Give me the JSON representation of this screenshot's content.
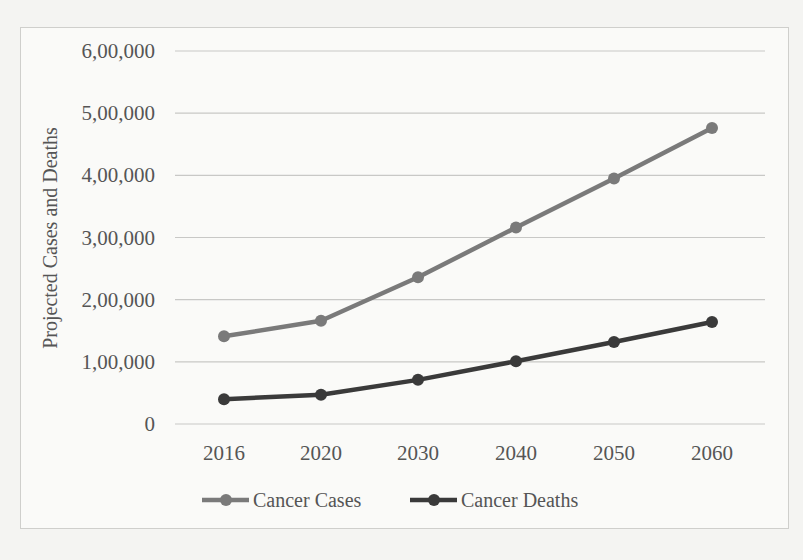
{
  "chart_data": {
    "type": "line",
    "title": "",
    "xlabel": "",
    "ylabel": "Projected Cases and Deaths",
    "categories": [
      "2016",
      "2020",
      "2030",
      "2040",
      "2050",
      "2060"
    ],
    "series": [
      {
        "name": "Cancer Cases",
        "color": "#7a7a7a",
        "values": [
          141000,
          166000,
          236000,
          316000,
          395000,
          476000
        ]
      },
      {
        "name": "Cancer Deaths",
        "color": "#3a3a3a",
        "values": [
          40000,
          47000,
          71000,
          101000,
          132000,
          164000
        ]
      }
    ],
    "ylim": [
      0,
      600000
    ],
    "y_ticks": [
      "0",
      "1,00,000",
      "2,00,000",
      "3,00,000",
      "4,00,000",
      "5,00,000",
      "6,00,000"
    ],
    "grid": true,
    "legend_position": "bottom"
  }
}
